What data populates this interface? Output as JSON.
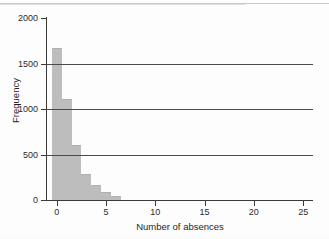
{
  "chart_data": {
    "type": "bar",
    "title": "",
    "subtitle": "",
    "xlabel": "Number of absences",
    "ylabel": "Frequency",
    "categories": [
      0,
      1,
      2,
      3,
      4,
      5,
      6
    ],
    "values": [
      1670,
      1110,
      610,
      290,
      160,
      85,
      40
    ],
    "series": [
      {
        "name": "Frequency",
        "values": [
          1670,
          1110,
          610,
          290,
          160,
          85,
          40
        ]
      }
    ],
    "xlim": [
      -1,
      26
    ],
    "ylim": [
      0,
      2000
    ],
    "xticks": [
      0,
      5,
      10,
      15,
      20,
      25
    ],
    "yticks": [
      0,
      500,
      1000,
      1500,
      2000
    ],
    "xtick_labels": [
      "0",
      "5",
      "10",
      "15",
      "20",
      "25"
    ],
    "ytick_labels": [
      "0",
      "500",
      "1000",
      "1500",
      "2000"
    ],
    "gridlines_y": [
      500,
      1000,
      1500
    ],
    "grid": "horizontal-only",
    "legend": "none",
    "bar_color": "#bdbdbd",
    "axis_color": "#3a3a3a",
    "annotations": []
  }
}
